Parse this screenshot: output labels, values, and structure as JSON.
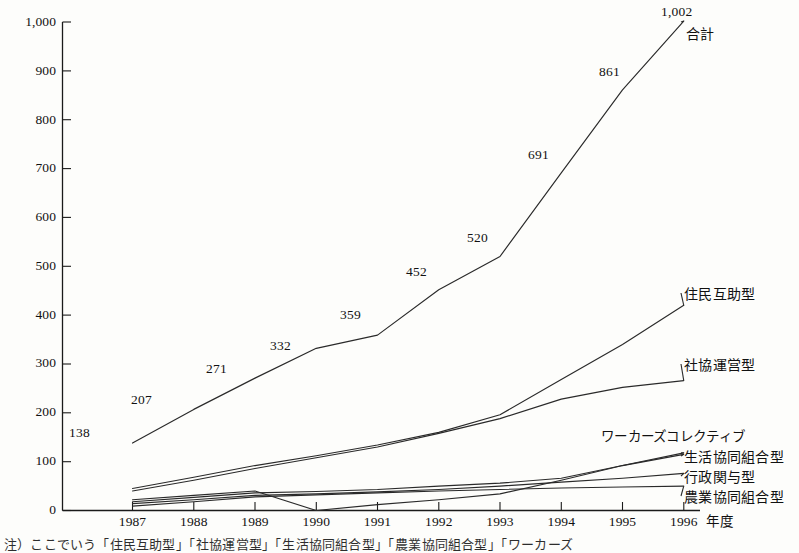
{
  "chart_data": {
    "type": "line",
    "title": "",
    "xlabel": "年度",
    "ylabel": "",
    "ylim": [
      0,
      1000
    ],
    "yticks": [
      0,
      100,
      200,
      300,
      400,
      500,
      600,
      700,
      800,
      900,
      1000
    ],
    "ytick_labels": [
      "0",
      "100",
      "200",
      "300",
      "400",
      "500",
      "600",
      "700",
      "800",
      "900",
      "1,000"
    ],
    "categories": [
      "1987",
      "1988",
      "1989",
      "1990",
      "1991",
      "1992",
      "1993",
      "1994",
      "1995",
      "1996"
    ],
    "grid": false,
    "legend_position": "right-inline",
    "series": [
      {
        "name": "合計",
        "label": "合計",
        "values": [
          138,
          207,
          271,
          332,
          359,
          452,
          520,
          691,
          861,
          1002
        ],
        "data_labels": [
          "138",
          "207",
          "271",
          "332",
          "359",
          "452",
          "520",
          "691",
          "861",
          "1,002"
        ]
      },
      {
        "name": "住民互助型",
        "label": "住民互助型",
        "values": [
          45,
          68,
          92,
          112,
          134,
          160,
          196,
          268,
          340,
          420
        ],
        "data_labels": []
      },
      {
        "name": "社協運営型",
        "label": "社協運営型",
        "values": [
          40,
          62,
          86,
          108,
          130,
          158,
          188,
          228,
          252,
          266
        ],
        "data_labels": []
      },
      {
        "name": "生活協同組合型",
        "label": "生活協同組合型",
        "values": [
          18,
          27,
          36,
          39,
          43,
          50,
          56,
          66,
          92,
          115
        ],
        "data_labels": []
      },
      {
        "name": "行政関与型",
        "label": "行政関与型",
        "values": [
          14,
          22,
          31,
          34,
          38,
          43,
          50,
          58,
          66,
          76
        ],
        "data_labels": []
      },
      {
        "name": "農業協同組合型",
        "label": "農業協同組合型",
        "values": [
          9,
          18,
          28,
          32,
          36,
          40,
          43,
          46,
          48,
          50
        ],
        "data_labels": []
      },
      {
        "name": "ワーカーズコレクティブ",
        "label": "ワーカーズコレクティブ",
        "values": [
          22,
          31,
          40,
          0,
          12,
          22,
          34,
          62,
          92,
          118
        ],
        "data_labels": []
      }
    ]
  },
  "axis": {
    "x_unit_label": "年度"
  },
  "caption": {
    "text": "注）ここでいう「住民互助型」「社協運営型」「生活協同組合型」「農業協同組合型」「ワーカーズ"
  }
}
